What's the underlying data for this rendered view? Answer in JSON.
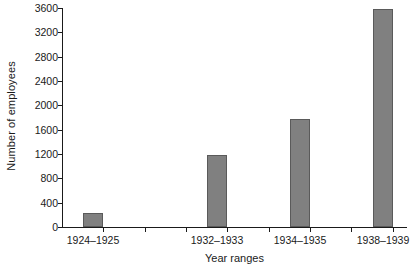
{
  "chart_data": {
    "type": "bar",
    "title": "",
    "xlabel": "Year ranges",
    "ylabel": "Number of employees",
    "categories": [
      "1924–1925",
      "1932–1933",
      "1934–1935",
      "1938–1939"
    ],
    "values": [
      230,
      1190,
      1780,
      3580
    ],
    "ylim": [
      0,
      3600
    ],
    "yticks": [
      0,
      400,
      800,
      1200,
      1600,
      2000,
      2400,
      2800,
      3200,
      3600
    ],
    "ytick_labels": [
      "0",
      "400",
      "800",
      "1200",
      "1600",
      "2000",
      "2400",
      "2800",
      "3200",
      "3600"
    ],
    "xtick_count": 8,
    "labeled_tick_indices": [
      0,
      3,
      5,
      7
    ],
    "grid": false,
    "legend": "none",
    "bar_fill_color": "#808080",
    "bar_edge_color": "#5a5a5a",
    "axis_color": "#1a1a1a",
    "background_color": "#ffffff"
  }
}
